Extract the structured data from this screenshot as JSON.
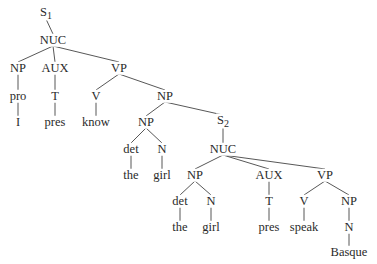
{
  "caption_fragment": "",
  "tree": {
    "nodes": [
      {
        "id": "s1",
        "label": "S",
        "sub": "1",
        "x": 46,
        "y": 13
      },
      {
        "id": "nuc1",
        "label": "NUC",
        "x": 53,
        "y": 40
      },
      {
        "id": "np1",
        "label": "NP",
        "x": 18,
        "y": 68
      },
      {
        "id": "aux1",
        "label": "AUX",
        "x": 55,
        "y": 68
      },
      {
        "id": "vp1",
        "label": "VP",
        "x": 119,
        "y": 68
      },
      {
        "id": "pro",
        "label": "pro",
        "x": 18,
        "y": 96
      },
      {
        "id": "t1",
        "label": "T",
        "x": 55,
        "y": 96
      },
      {
        "id": "v1",
        "label": "V",
        "x": 96,
        "y": 96
      },
      {
        "id": "np2",
        "label": "NP",
        "x": 165,
        "y": 96
      },
      {
        "id": "i",
        "label": "I",
        "x": 18,
        "y": 122
      },
      {
        "id": "pres1",
        "label": "pres",
        "x": 55,
        "y": 122
      },
      {
        "id": "know",
        "label": "know",
        "x": 96,
        "y": 122
      },
      {
        "id": "np3",
        "label": "NP",
        "x": 146,
        "y": 122
      },
      {
        "id": "s2",
        "label": "S",
        "sub": "2",
        "x": 223,
        "y": 121
      },
      {
        "id": "det1",
        "label": "det",
        "x": 131,
        "y": 149
      },
      {
        "id": "n1",
        "label": "N",
        "x": 162,
        "y": 149
      },
      {
        "id": "nuc2",
        "label": "NUC",
        "x": 223,
        "y": 149
      },
      {
        "id": "the1",
        "label": "the",
        "x": 131,
        "y": 175
      },
      {
        "id": "girl1",
        "label": "girl",
        "x": 162,
        "y": 175
      },
      {
        "id": "np4",
        "label": "NP",
        "x": 195,
        "y": 175
      },
      {
        "id": "aux2",
        "label": "AUX",
        "x": 269,
        "y": 175
      },
      {
        "id": "vp2",
        "label": "VP",
        "x": 325,
        "y": 175
      },
      {
        "id": "det2",
        "label": "det",
        "x": 180,
        "y": 201
      },
      {
        "id": "n2",
        "label": "N",
        "x": 211,
        "y": 201
      },
      {
        "id": "t2",
        "label": "T",
        "x": 269,
        "y": 201
      },
      {
        "id": "v2",
        "label": "V",
        "x": 304,
        "y": 201
      },
      {
        "id": "np5",
        "label": "NP",
        "x": 349,
        "y": 201
      },
      {
        "id": "the2",
        "label": "the",
        "x": 180,
        "y": 227
      },
      {
        "id": "girl2",
        "label": "girl",
        "x": 211,
        "y": 227
      },
      {
        "id": "pres2",
        "label": "pres",
        "x": 269,
        "y": 227
      },
      {
        "id": "speak",
        "label": "speak",
        "x": 304,
        "y": 227
      },
      {
        "id": "n3",
        "label": "N",
        "x": 349,
        "y": 227
      },
      {
        "id": "basque",
        "label": "Basque",
        "x": 349,
        "y": 252
      }
    ],
    "edges": [
      [
        "s1",
        "nuc1"
      ],
      [
        "nuc1",
        "np1"
      ],
      [
        "nuc1",
        "aux1"
      ],
      [
        "nuc1",
        "vp1"
      ],
      [
        "np1",
        "pro"
      ],
      [
        "aux1",
        "t1"
      ],
      [
        "vp1",
        "v1"
      ],
      [
        "vp1",
        "np2"
      ],
      [
        "pro",
        "i"
      ],
      [
        "t1",
        "pres1"
      ],
      [
        "v1",
        "know"
      ],
      [
        "np2",
        "np3"
      ],
      [
        "np2",
        "s2"
      ],
      [
        "np3",
        "det1"
      ],
      [
        "np3",
        "n1"
      ],
      [
        "det1",
        "the1"
      ],
      [
        "n1",
        "girl1"
      ],
      [
        "s2",
        "nuc2"
      ],
      [
        "nuc2",
        "np4"
      ],
      [
        "nuc2",
        "aux2"
      ],
      [
        "nuc2",
        "vp2"
      ],
      [
        "np4",
        "det2"
      ],
      [
        "np4",
        "n2"
      ],
      [
        "det2",
        "the2"
      ],
      [
        "n2",
        "girl2"
      ],
      [
        "aux2",
        "t2"
      ],
      [
        "t2",
        "pres2"
      ],
      [
        "vp2",
        "v2"
      ],
      [
        "vp2",
        "np5"
      ],
      [
        "v2",
        "speak"
      ],
      [
        "np5",
        "n3"
      ],
      [
        "n3",
        "basque"
      ]
    ]
  }
}
